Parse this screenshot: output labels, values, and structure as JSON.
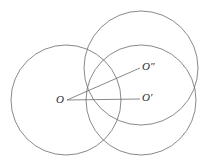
{
  "figure": {
    "background_color": "#ffffff",
    "stroke_color": "#6b6b6b",
    "label_color": "#2b2b2b",
    "stroke_width": 0.8,
    "width": 205,
    "height": 163
  },
  "labels": {
    "center_O": "O",
    "center_O_prime": "O′",
    "center_O_double_prime": "O″"
  },
  "chart_data": {
    "type": "diagram",
    "xlabel": "",
    "ylabel": "",
    "xlim": [
      0,
      205
    ],
    "ylim": [
      0,
      163
    ],
    "grid": false,
    "legend": "none",
    "circles": [
      {
        "name": "circle-O",
        "label": "O",
        "center_x": 66,
        "center_y": 100,
        "radius": 55,
        "stroke": "#6b6b6b",
        "fill": "none"
      },
      {
        "name": "circle-O-double-prime",
        "label": "O″",
        "center_x": 141,
        "center_y": 68,
        "radius": 57,
        "stroke": "#6b6b6b",
        "fill": "none"
      },
      {
        "name": "circle-O-prime",
        "label": "O′",
        "center_x": 141,
        "center_y": 100,
        "radius": 55,
        "stroke": "#6b6b6b",
        "fill": "none"
      }
    ],
    "segments": [
      {
        "name": "segment-O-to-O-prime",
        "x1": 67,
        "y1": 100,
        "x2": 140,
        "y2": 99,
        "stroke": "#6b6b6b"
      },
      {
        "name": "segment-O-to-O-double-prime",
        "x1": 67,
        "y1": 100,
        "x2": 140,
        "y2": 68,
        "stroke": "#6b6b6b"
      }
    ],
    "points": [
      {
        "name": "point-O",
        "label": "O",
        "x": 66,
        "y": 100
      },
      {
        "name": "point-O-prime",
        "label": "O′",
        "x": 141,
        "y": 100
      },
      {
        "name": "point-O-double-prime",
        "label": "O″",
        "x": 141,
        "y": 68
      }
    ]
  }
}
